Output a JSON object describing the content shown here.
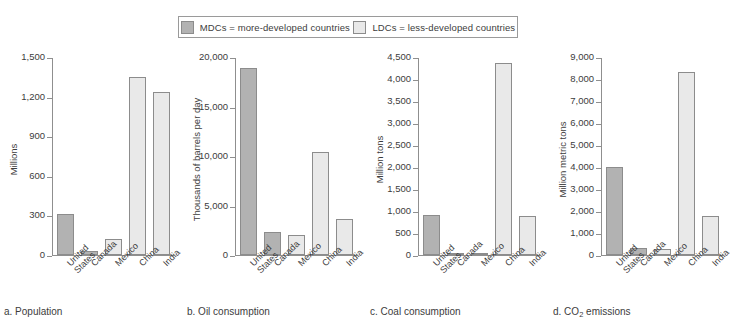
{
  "legend": {
    "entries": [
      {
        "key": "mdc",
        "swatch_color": "#b2b2b2",
        "label": "MDCs = more-developed countries"
      },
      {
        "key": "ldc",
        "swatch_color": "#e9e9e9",
        "label": "LDCs = less-developed countries"
      }
    ]
  },
  "countries": [
    "United\nStates",
    "Canada",
    "Mexico",
    "China",
    "India"
  ],
  "chart_data": [
    {
      "type": "bar",
      "panel_id": "a",
      "title": "a. Population",
      "xlabel": "",
      "ylabel": "Millions",
      "categories": [
        "United States",
        "Canada",
        "Mexico",
        "China",
        "India"
      ],
      "groups": [
        "MDC",
        "MDC",
        "LDC",
        "LDC",
        "LDC"
      ],
      "values": [
        310,
        33,
        125,
        1355,
        1240
      ],
      "ylim": [
        0,
        1500
      ],
      "yticks": [
        0,
        300,
        600,
        900,
        1200,
        1500
      ],
      "ytick_labels": [
        "0",
        "300",
        "600",
        "900",
        "1,200",
        "1,500"
      ],
      "grid": false,
      "legend_position": "top-center"
    },
    {
      "type": "bar",
      "panel_id": "b",
      "title": "b. Oil consumption",
      "xlabel": "",
      "ylabel": "Thousands of barrels per day",
      "categories": [
        "United States",
        "Canada",
        "Mexico",
        "China",
        "India"
      ],
      "groups": [
        "MDC",
        "MDC",
        "LDC",
        "LDC",
        "LDC"
      ],
      "values": [
        19000,
        2350,
        2050,
        10500,
        3700
      ],
      "ylim": [
        0,
        20000
      ],
      "yticks": [
        0,
        5000,
        10000,
        15000,
        20000
      ],
      "ytick_labels": [
        "0",
        "5,000",
        "10,000",
        "15,000",
        "20,000"
      ],
      "grid": false,
      "legend_position": "top-center"
    },
    {
      "type": "bar",
      "panel_id": "c",
      "title": "c. Coal consumption",
      "xlabel": "",
      "ylabel": "Million tons",
      "categories": [
        "United States",
        "Canada",
        "Mexico",
        "China",
        "India"
      ],
      "groups": [
        "MDC",
        "MDC",
        "LDC",
        "LDC",
        "LDC"
      ],
      "values": [
        925,
        45,
        25,
        4380,
        880
      ],
      "ylim": [
        0,
        4500
      ],
      "yticks": [
        0,
        500,
        1000,
        1500,
        2000,
        2500,
        3000,
        3500,
        4000,
        4500
      ],
      "ytick_labels": [
        "0",
        "500",
        "1,000",
        "1,500",
        "2,000",
        "2,500",
        "3,000",
        "3,500",
        "4,000",
        "4,500"
      ],
      "grid": false,
      "legend_position": "top-center"
    },
    {
      "type": "bar",
      "panel_id": "d",
      "title": "d. CO2 emissions",
      "title_prefix": "d. CO",
      "title_sub": "2",
      "title_suffix": " emissions",
      "xlabel": "",
      "ylabel": "Million metric tons",
      "categories": [
        "United States",
        "Canada",
        "Mexico",
        "China",
        "India"
      ],
      "groups": [
        "MDC",
        "MDC",
        "LDC",
        "LDC",
        "LDC"
      ],
      "values": [
        4000,
        340,
        280,
        8350,
        1780
      ],
      "ylim": [
        0,
        9000
      ],
      "yticks": [
        0,
        1000,
        2000,
        3000,
        4000,
        5000,
        6000,
        7000,
        8000,
        9000
      ],
      "ytick_labels": [
        "0",
        "1,000",
        "2,000",
        "3,000",
        "4,000",
        "5,000",
        "6,000",
        "7,000",
        "8,000",
        "9,000"
      ],
      "grid": false,
      "legend_position": "top-center"
    }
  ],
  "colors": {
    "mdc_fill": "#b2b2b2",
    "ldc_fill": "#e9e9e9",
    "bar_stroke": "#8c8c8c",
    "axis": "#8f8f8f",
    "text": "#3c3c3c",
    "background": "#ffffff"
  }
}
